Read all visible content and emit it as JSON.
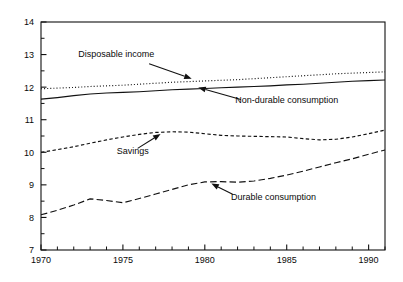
{
  "chart_data": {
    "type": "line",
    "title": "",
    "subtitle": "",
    "xlabel": "",
    "ylabel": "",
    "xlim": [
      1970,
      1991
    ],
    "ylim": [
      7,
      14
    ],
    "grid": false,
    "legend_position": "inline-annotations",
    "x_ticks_major": [
      1970,
      1975,
      1980,
      1985,
      1990
    ],
    "x_tick_labels": [
      "1970",
      "1975",
      "1980",
      "1985",
      "1990"
    ],
    "x_ticks_minor_step": 1,
    "y_ticks_major": [
      7,
      8,
      9,
      10,
      11,
      12,
      13,
      14
    ],
    "y_tick_labels": [
      "7",
      "8",
      "9",
      "10",
      "11",
      "12",
      "13",
      "14"
    ],
    "y_ticks_minor_step": 0.5,
    "x": [
      1970,
      1971,
      1972,
      1973,
      1974,
      1975,
      1976,
      1977,
      1978,
      1979,
      1980,
      1981,
      1982,
      1983,
      1984,
      1985,
      1986,
      1987,
      1988,
      1989,
      1990,
      1991
    ],
    "series": [
      {
        "name": "Disposable income",
        "style": "dotted",
        "color": "#111111",
        "values": [
          11.95,
          11.97,
          11.99,
          12.02,
          12.04,
          12.06,
          12.09,
          12.12,
          12.15,
          12.17,
          12.19,
          12.21,
          12.23,
          12.26,
          12.29,
          12.32,
          12.35,
          12.38,
          12.41,
          12.43,
          12.45,
          12.47
        ]
      },
      {
        "name": "Non-durable consumption",
        "style": "solid",
        "color": "#111111",
        "values": [
          11.63,
          11.68,
          11.74,
          11.79,
          11.82,
          11.84,
          11.86,
          11.89,
          11.92,
          11.94,
          11.96,
          11.98,
          12.0,
          12.02,
          12.04,
          12.07,
          12.09,
          12.12,
          12.15,
          12.18,
          12.2,
          12.22
        ]
      },
      {
        "name": "Savings",
        "style": "dashed-short",
        "color": "#111111",
        "values": [
          10.0,
          10.08,
          10.17,
          10.28,
          10.38,
          10.47,
          10.55,
          10.61,
          10.63,
          10.62,
          10.57,
          10.52,
          10.5,
          10.49,
          10.48,
          10.47,
          10.42,
          10.38,
          10.4,
          10.47,
          10.57,
          10.68
        ]
      },
      {
        "name": "Durable consumption",
        "style": "dashed-long",
        "color": "#111111",
        "values": [
          8.08,
          8.22,
          8.38,
          8.57,
          8.52,
          8.45,
          8.58,
          8.72,
          8.86,
          9.0,
          9.09,
          9.1,
          9.08,
          9.12,
          9.2,
          9.3,
          9.42,
          9.55,
          9.68,
          9.8,
          9.94,
          10.07
        ]
      }
    ],
    "annotations": [
      {
        "label": "Disposable income",
        "text_x": 1974.6,
        "text_y": 12.93,
        "anchor": "middle",
        "arrow_from": [
          1976.6,
          12.72
        ],
        "arrow_to": [
          1979.2,
          12.26
        ]
      },
      {
        "label": "Non-durable consumption",
        "text_x": 1985.0,
        "text_y": 11.5,
        "anchor": "middle",
        "arrow_from": [
          1982.2,
          11.62
        ],
        "arrow_to": [
          1979.6,
          11.99
        ]
      },
      {
        "label": "Savings",
        "text_x": 1975.6,
        "text_y": 9.94,
        "anchor": "middle",
        "arrow_from": [
          1975.9,
          10.12
        ],
        "arrow_to": [
          1977.3,
          10.56
        ]
      },
      {
        "label": "Durable consumption",
        "text_x": 1984.2,
        "text_y": 8.55,
        "anchor": "middle",
        "arrow_from": [
          1981.7,
          8.71
        ],
        "arrow_to": [
          1980.4,
          9.04
        ]
      }
    ]
  }
}
